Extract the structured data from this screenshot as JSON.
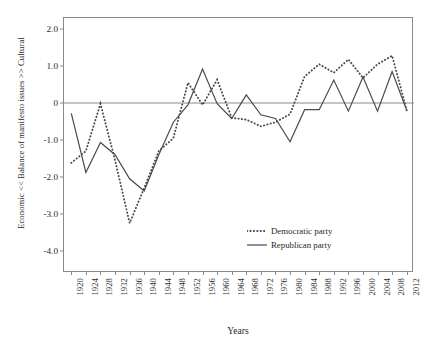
{
  "figure": {
    "xlabel": "Years",
    "ylabel": "Economic << Balance of manifesto issues >> Cultural"
  },
  "legend": {
    "items": [
      {
        "label": "Democratic party",
        "style": "dotted",
        "color": "#4a4a4a"
      },
      {
        "label": "Republican party",
        "style": "solid",
        "color": "#4a4a4a"
      }
    ]
  },
  "axes": {
    "y_ticks": [
      "2.0",
      "1.0",
      "0",
      "-1.0",
      "-2.0",
      "-3.0",
      "-4.0"
    ],
    "y_tick_values": [
      2.0,
      1.0,
      0,
      -1.0,
      -2.0,
      -3.0,
      -4.0
    ],
    "x_ticks": [
      "1920",
      "1924",
      "1928",
      "1932",
      "1936",
      "1940",
      "1944",
      "1948",
      "1952",
      "1956",
      "1960",
      "1964",
      "1968",
      "1972",
      "1976",
      "1980",
      "1984",
      "1988",
      "1992",
      "1996",
      "2000",
      "2004",
      "2008",
      "2012"
    ]
  },
  "chart_data": {
    "type": "line",
    "title": "",
    "xlabel": "Years",
    "ylabel": "Economic << Balance of manifesto issues >> Cultural",
    "x": [
      1920,
      1924,
      1928,
      1932,
      1936,
      1940,
      1944,
      1948,
      1952,
      1956,
      1960,
      1964,
      1968,
      1972,
      1976,
      1980,
      1984,
      1988,
      1992,
      1996,
      2000,
      2004,
      2008,
      2012
    ],
    "xlim": [
      1918,
      2014
    ],
    "ylim": [
      -4.6,
      2.3
    ],
    "grid": false,
    "zero_line": true,
    "legend_position": "lower-right-inside",
    "series": [
      {
        "name": "Democratic party",
        "style": "dotted",
        "color": "#4a4a4a",
        "values": [
          -1.62,
          -1.3,
          -0.02,
          -1.55,
          -3.25,
          -2.3,
          -1.3,
          -0.95,
          0.55,
          -0.05,
          0.63,
          -0.4,
          -0.45,
          -0.63,
          -0.52,
          -0.3,
          0.72,
          1.05,
          0.82,
          1.18,
          0.68,
          1.05,
          1.28,
          -0.2
        ]
      },
      {
        "name": "Republican party",
        "style": "solid",
        "color": "#4a4a4a",
        "values": [
          -0.28,
          -1.88,
          -1.07,
          -1.4,
          -2.05,
          -2.38,
          -1.4,
          -0.52,
          -0.05,
          0.92,
          -0.02,
          -0.42,
          0.22,
          -0.32,
          -0.42,
          -1.05,
          -0.18,
          -0.18,
          0.62,
          -0.22,
          0.7,
          -0.22,
          0.85,
          -0.2
        ]
      }
    ]
  }
}
